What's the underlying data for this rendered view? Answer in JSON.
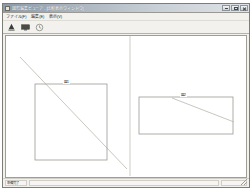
{
  "window": {
    "title": "図形編集ビューア - [比較表示ウィンドウ]",
    "icon": "app-window-icon",
    "controls": {
      "minimize": "最小化",
      "maximize": "最大化",
      "close": "閉じる"
    }
  },
  "menubar": {
    "items": [
      {
        "label": "ファイル(F)",
        "name": "menu-file"
      },
      {
        "label": "編集(E)",
        "name": "menu-edit"
      },
      {
        "label": "表示(V)",
        "name": "menu-view"
      }
    ]
  },
  "toolbar": {
    "buttons": [
      {
        "label": "塗りつぶし",
        "icon": "fill-bucket-icon",
        "name": "toolbar-fill"
      },
      {
        "label": "表示切替",
        "icon": "monitor-icon",
        "name": "toolbar-display"
      },
      {
        "label": "更新",
        "icon": "refresh-clock-icon",
        "name": "toolbar-refresh"
      }
    ]
  },
  "canvas": {
    "divider_x": 124,
    "panels": [
      {
        "name": "left-panel",
        "shape": {
          "label": "図1",
          "type": "rect",
          "x": 29,
          "y": 48,
          "width": 72,
          "height": 76
        },
        "line": {
          "label": "対角線",
          "x1": 14,
          "y1": 21,
          "x2": 121,
          "y2": 133
        }
      },
      {
        "name": "right-panel",
        "shape": {
          "label": "図2",
          "type": "rect",
          "x": 133,
          "y": 61,
          "width": 94,
          "height": 37
        },
        "line": {
          "label": "対角線",
          "x1": 166,
          "y1": 62,
          "x2": 228,
          "y2": 86
        }
      }
    ]
  },
  "statusbar": {
    "left": "準備完了",
    "middle": "",
    "right": ""
  }
}
